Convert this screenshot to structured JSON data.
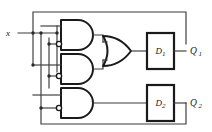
{
  "diagram": {
    "colors": {
      "background": "#ffffff",
      "wire": "#3a3a3a",
      "gate_outline": "#1a1a1a",
      "label": "#1a1a1a"
    }
  },
  "inputs": [
    {
      "id": "x",
      "label": "x"
    }
  ],
  "outputs": [
    {
      "id": "Q1",
      "label": "Q",
      "subscript": "1"
    },
    {
      "id": "Q2",
      "label": "Q",
      "subscript": "2"
    }
  ],
  "gates": [
    {
      "id": "and1",
      "type": "and",
      "label": "AND gate 1",
      "inverted_inputs": [
        1
      ]
    },
    {
      "id": "and2",
      "type": "and",
      "label": "AND gate 2",
      "inverted_inputs": [
        1
      ]
    },
    {
      "id": "and3",
      "type": "and",
      "label": "AND gate 3",
      "inverted_inputs": [
        1
      ]
    },
    {
      "id": "or1",
      "type": "or",
      "label": "OR gate 1",
      "inverted_inputs": []
    }
  ],
  "flipflops": [
    {
      "id": "ff1",
      "label": "D",
      "subscript": "1",
      "output": "Q1"
    },
    {
      "id": "ff2",
      "label": "D",
      "subscript": "2",
      "output": "Q2"
    }
  ],
  "feedback": [
    {
      "id": "fb-top",
      "from": "Q1",
      "to": "gate-inputs",
      "route": "over-top"
    },
    {
      "id": "fb-bottom",
      "from": "Q2",
      "to": "gate-inputs",
      "route": "under-bottom"
    }
  ]
}
